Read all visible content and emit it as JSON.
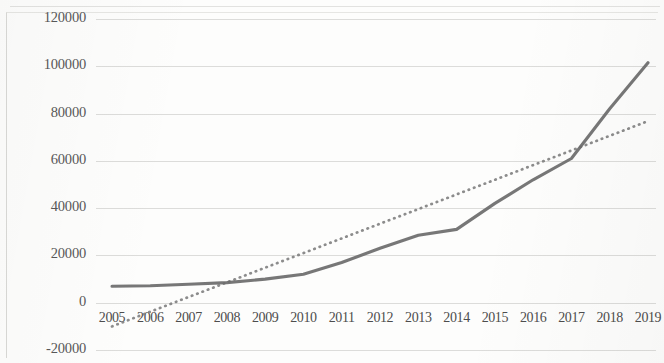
{
  "chart_data": {
    "type": "line",
    "title": "",
    "subtitle": "",
    "xlabel": "",
    "ylabel": "",
    "categories": [
      "2005",
      "2006",
      "2007",
      "2008",
      "2009",
      "2010",
      "2011",
      "2012",
      "2013",
      "2014",
      "2015",
      "2016",
      "2017",
      "2018",
      "2019"
    ],
    "series": [
      {
        "name": "series-1",
        "style": "solid",
        "color": "#6b6b6b",
        "values": [
          7000,
          7200,
          7800,
          8500,
          10000,
          12000,
          17000,
          23000,
          28500,
          31000,
          42000,
          52000,
          61000,
          82000,
          101500
        ]
      },
      {
        "name": "trendline",
        "style": "dotted",
        "color": "#7c7c7c",
        "values": [
          -10000,
          -3800,
          2400,
          8600,
          14800,
          21000,
          27200,
          33400,
          39600,
          45800,
          52000,
          58200,
          64400,
          70600,
          76800
        ]
      }
    ],
    "ylim": [
      -20000,
      120000
    ],
    "yticks": [
      120000,
      100000,
      80000,
      60000,
      40000,
      20000,
      0,
      -20000
    ],
    "ytick_labels": [
      "120000",
      "100000",
      "80000",
      "60000",
      "40000",
      "20000",
      "0",
      "-20000"
    ],
    "xticks": [
      "2005",
      "2006",
      "2007",
      "2008",
      "2009",
      "2010",
      "2011",
      "2012",
      "2013",
      "2014",
      "2015",
      "2016",
      "2017",
      "2018",
      "2019"
    ],
    "grid": true,
    "grid_axis": "y",
    "legend": "none",
    "legend_position": "none",
    "annotations": []
  }
}
